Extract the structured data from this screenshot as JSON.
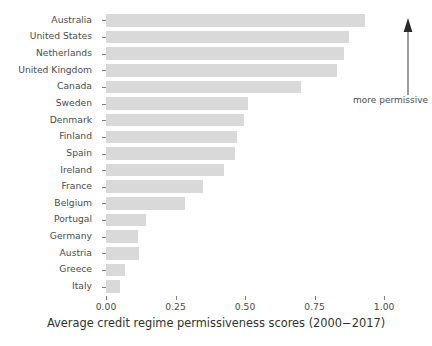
{
  "chart_data": {
    "type": "bar",
    "orientation": "horizontal",
    "title": "",
    "xlabel": "Average credit regime permissiveness scores (2000−2017)",
    "ylabel": "",
    "xlim": [
      0,
      1.05
    ],
    "xticks": [
      "0.00",
      "0.25",
      "0.50",
      "0.75",
      "1.00"
    ],
    "xtick_values": [
      0.0,
      0.25,
      0.5,
      0.75,
      1.0
    ],
    "grid": false,
    "legend": null,
    "bar_color": "#d9d9d9",
    "categories": [
      "Australia",
      "United States",
      "Netherlands",
      "United Kingdom",
      "Canada",
      "Sweden",
      "Denmark",
      "Finland",
      "Spain",
      "Ireland",
      "France",
      "Belgium",
      "Portugal",
      "Germany",
      "Austria",
      "Greece",
      "Italy"
    ],
    "values": [
      0.93,
      0.875,
      0.855,
      0.83,
      0.7,
      0.51,
      0.495,
      0.47,
      0.465,
      0.425,
      0.35,
      0.285,
      0.145,
      0.115,
      0.12,
      0.07,
      0.05
    ],
    "annotations": [
      {
        "name": "more-permissive-arrow",
        "text": "more permissive",
        "direction": "up"
      }
    ]
  }
}
